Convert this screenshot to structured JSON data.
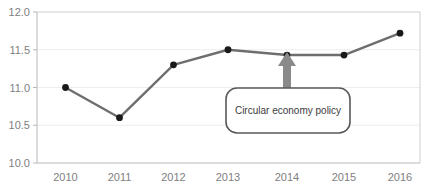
{
  "chart_data": {
    "type": "line",
    "title": "",
    "xlabel": "",
    "ylabel": "",
    "categories": [
      "2010",
      "2011",
      "2012",
      "2013",
      "2014",
      "2015",
      "2016"
    ],
    "values": [
      11.0,
      10.6,
      11.3,
      11.5,
      11.43,
      11.43,
      11.72
    ],
    "series": [
      {
        "name": "",
        "values": [
          11.0,
          10.6,
          11.3,
          11.5,
          11.43,
          11.43,
          11.72
        ]
      }
    ],
    "x": [
      2010,
      2011,
      2012,
      2013,
      2014,
      2015,
      2016
    ],
    "ylim": [
      10.0,
      12.0
    ],
    "xlim": [
      2009.6,
      2016.4
    ],
    "ytick_labels": [
      "10.0",
      "10.5",
      "11.0",
      "11.5",
      "12.0"
    ],
    "ytick_values": [
      10.0,
      10.5,
      11.0,
      11.5,
      12.0
    ],
    "xtick_labels": [
      "2010",
      "2011",
      "2012",
      "2013",
      "2014",
      "2015",
      "2016"
    ],
    "grid": true,
    "grid_axis": "y",
    "legend": false,
    "legend_position": "none",
    "annotations": [
      {
        "text": "Circular economy policy",
        "points_to_category": "2014",
        "points_to_value": 11.43,
        "marker": "up-arrow"
      }
    ],
    "colors": {
      "line": "#6e6e6e",
      "marker": "#1a1a1a",
      "grid": "#e8e8e8",
      "axis": "#c8c8c8",
      "tick_label": "#808080",
      "annotation_border": "#595959",
      "annotation_text": "#3b3b3b",
      "arrow": "#808080",
      "background": "#ffffff"
    }
  },
  "annotation_box": {
    "label": "Circular economy policy"
  },
  "axes": {
    "y_labels": [
      "12.0",
      "11.5",
      "11.0",
      "10.5",
      "10.0"
    ],
    "x_labels": [
      "2010",
      "2011",
      "2012",
      "2013",
      "2014",
      "2015",
      "2016"
    ]
  }
}
